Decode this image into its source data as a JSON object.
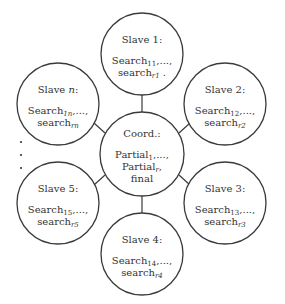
{
  "diagram": {
    "colors": {
      "stroke": "#3a3a3a",
      "text": "#333333",
      "background": "#ffffff"
    },
    "coordinator": {
      "title": "Coord.:",
      "lines": [
        {
          "base": "Partial",
          "sub": "1",
          "suffix": ",...,"
        },
        {
          "base": "Partial",
          "sub": "r",
          "suffix": ","
        },
        {
          "base": "final",
          "sub": "",
          "suffix": ""
        }
      ]
    },
    "slaves": [
      {
        "id": "slave-1",
        "title_prefix": "Slave ",
        "title_var": "1",
        "title_suffix": ":",
        "line1": {
          "base": "Search",
          "sub": "11",
          "suffix": ",...,"
        },
        "line2": {
          "base": "search",
          "sub": "r1",
          "suffix": " ."
        }
      },
      {
        "id": "slave-2",
        "title_prefix": "Slave ",
        "title_var": "2",
        "title_suffix": ":",
        "line1": {
          "base": "Search",
          "sub": "12",
          "suffix": ",...,"
        },
        "line2": {
          "base": "search",
          "sub": "r2",
          "suffix": ""
        }
      },
      {
        "id": "slave-3",
        "title_prefix": "Slave ",
        "title_var": "3",
        "title_suffix": ":",
        "line1": {
          "base": "Search",
          "sub": "13",
          "suffix": ",...,"
        },
        "line2": {
          "base": "search",
          "sub": "r3",
          "suffix": ""
        }
      },
      {
        "id": "slave-4",
        "title_prefix": "Slave ",
        "title_var": "4",
        "title_suffix": ":",
        "line1": {
          "base": "Search",
          "sub": "14",
          "suffix": ",...,"
        },
        "line2": {
          "base": "search",
          "sub": "r4",
          "suffix": ""
        }
      },
      {
        "id": "slave-5",
        "title_prefix": "Slave ",
        "title_var": "5",
        "title_suffix": ":",
        "line1": {
          "base": "Search",
          "sub": "15",
          "suffix": ",...,"
        },
        "line2": {
          "base": "search",
          "sub": "r5",
          "suffix": ""
        }
      },
      {
        "id": "slave-n",
        "title_prefix": "Slave ",
        "title_var": "n",
        "title_suffix": ":",
        "line1": {
          "base": "Search",
          "sub": "1n",
          "suffix": ",...,"
        },
        "line2": {
          "base": "search",
          "sub": "rn",
          "suffix": ""
        }
      }
    ],
    "ellipsis": "· · ·"
  }
}
